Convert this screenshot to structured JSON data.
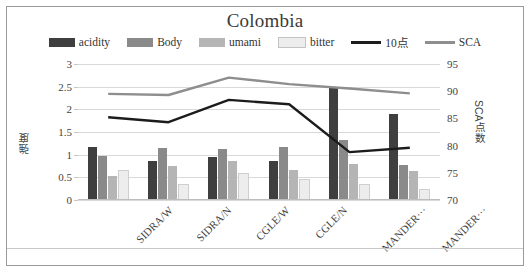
{
  "chart_data": {
    "type": "bar",
    "title": "Colombia",
    "xlabel": "",
    "ylabel": "強度",
    "y2label": "SCA点数",
    "ylim": [
      0,
      3
    ],
    "y2lim": [
      70,
      95
    ],
    "yticks": [
      "0",
      "0.5",
      "1",
      "1.5",
      "2",
      "2.5",
      "3"
    ],
    "y2ticks": [
      "70",
      "75",
      "80",
      "85",
      "90",
      "95"
    ],
    "grid": true,
    "legend_position": "top",
    "categories": [
      "SIDRA/W",
      "SIDRA/N",
      "CGLE/W",
      "CGLE/N",
      "MANDER···",
      "MANDER···"
    ],
    "series": [
      {
        "name": "acidity",
        "kind": "bar",
        "axis": "left",
        "color": "#3f3f3f",
        "values": [
          1.17,
          0.87,
          0.95,
          0.85,
          2.5,
          1.9
        ]
      },
      {
        "name": "Body",
        "kind": "bar",
        "axis": "left",
        "color": "#8a8a8a",
        "values": [
          0.97,
          1.14,
          1.13,
          1.18,
          1.32,
          0.78
        ]
      },
      {
        "name": "umami",
        "kind": "bar",
        "axis": "left",
        "color": "#b5b5b5",
        "values": [
          0.52,
          0.75,
          0.85,
          0.67,
          0.8,
          0.63
        ]
      },
      {
        "name": "bitter",
        "kind": "bar",
        "axis": "left",
        "color": "#ededed",
        "values": [
          0.62,
          0.3,
          0.55,
          0.42,
          0.3,
          0.2
        ]
      },
      {
        "name": "10点",
        "kind": "line",
        "axis": "right",
        "color": "#1c1c1c",
        "values": [
          85.2,
          84.3,
          88.4,
          87.6,
          78.8,
          79.6
        ]
      },
      {
        "name": "SCA",
        "kind": "line",
        "axis": "right",
        "color": "#8e8e8e",
        "values": [
          89.5,
          89.3,
          92.5,
          91.3,
          90.5,
          89.6
        ]
      }
    ]
  },
  "legend": {
    "items": [
      {
        "label": "acidity",
        "type": "swatch",
        "color": "#3f3f3f"
      },
      {
        "label": "Body",
        "type": "swatch",
        "color": "#8a8a8a"
      },
      {
        "label": "umami",
        "type": "swatch",
        "color": "#b5b5b5"
      },
      {
        "label": "bitter",
        "type": "swatch",
        "color": "#ededed"
      },
      {
        "label": "10点",
        "type": "line",
        "color": "#1c1c1c"
      },
      {
        "label": "SCA",
        "type": "line",
        "color": "#8e8e8e"
      }
    ]
  }
}
